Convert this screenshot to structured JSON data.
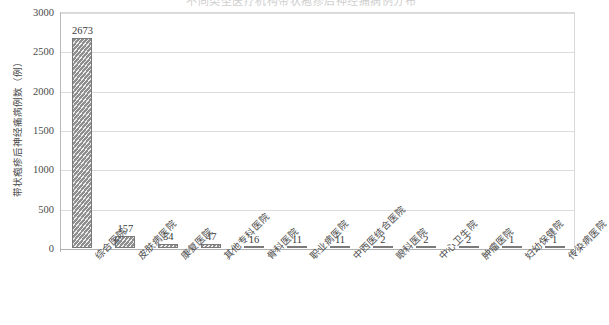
{
  "chart_data": {
    "type": "bar",
    "title": "不同类型医疗机构带状疱疹后神经痛病例分布",
    "xlabel": "",
    "ylabel": "带状疱疹后神经痛病例数（例）",
    "ylim": [
      0,
      3000
    ],
    "ytick_labels": [
      "0",
      "500",
      "1000",
      "1500",
      "2000",
      "2500",
      "3000"
    ],
    "ytick_values": [
      0,
      500,
      1000,
      1500,
      2000,
      2500,
      3000
    ],
    "grid": true,
    "legend": "none",
    "categories": [
      "综合医院",
      "皮肤病医院",
      "康复医院",
      "其他专科医院",
      "骨科医院",
      "职业病医院",
      "中西医结合医院",
      "眼科医院",
      "中心卫生院",
      "肿瘤医院",
      "妇幼保健院",
      "传染病医院"
    ],
    "values": [
      2673,
      157,
      54,
      47,
      16,
      11,
      11,
      2,
      2,
      2,
      1,
      1
    ],
    "value_labels": [
      "2673",
      "157",
      "54",
      "47",
      "16",
      "11",
      "11",
      "2",
      "2",
      "2",
      "1",
      "1"
    ],
    "bar_color": "#8f8f8f",
    "bar_pattern": "diagonal-hatch",
    "grid_color": "#dcdcdc",
    "axis_color": "#b0b0b0"
  }
}
